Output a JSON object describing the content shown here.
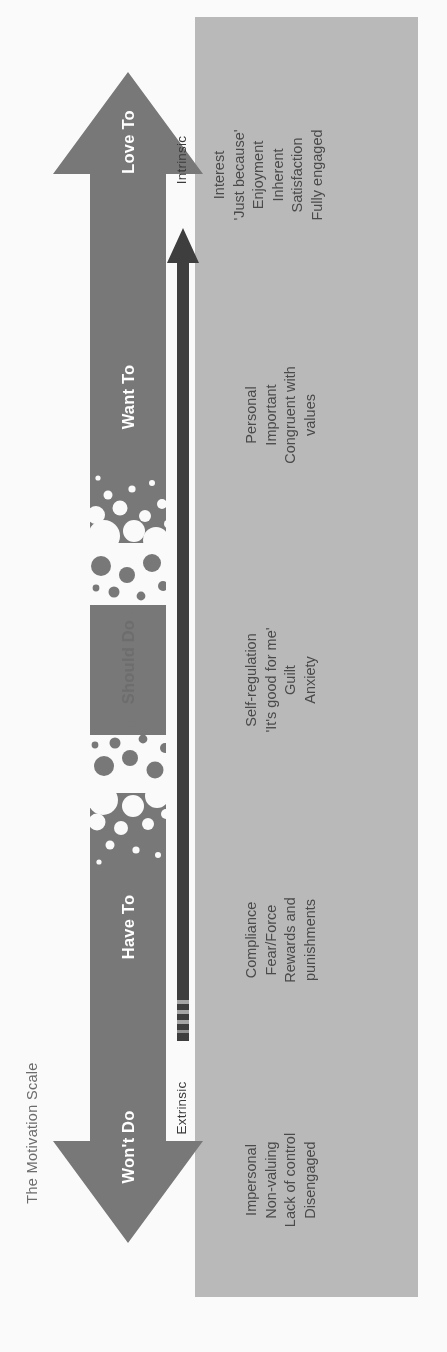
{
  "title": "The Motivation Scale",
  "colors": {
    "arrow_fill": "#7a7a7a",
    "panel_fill": "#bdbdbd",
    "inner_arrow": "#3f3f3f",
    "band_text": "#ffffff",
    "should_do_text": "#6d6d6d",
    "descriptor_text": "#4a4a4a",
    "title_text": "#6e6e6e",
    "page_background": "#ffffff"
  },
  "axis": {
    "low_end_label": "Extrinsic",
    "high_end_label": "Intrinsic"
  },
  "bands": [
    {
      "label": "Love To",
      "style": "white",
      "descriptors": [
        "Interest",
        "'Just because'",
        "Enjoyment",
        "Inherent",
        "Satisfaction",
        "Fully engaged"
      ]
    },
    {
      "label": "Want To",
      "style": "white",
      "descriptors": [
        "Personal",
        "Important",
        "Congruent with",
        "values"
      ]
    },
    {
      "label": "Should Do",
      "style": "dark",
      "descriptors": [
        "Self-regulation",
        "'It's good for me'",
        "Guilt",
        "Anxiety"
      ]
    },
    {
      "label": "Have To",
      "style": "white",
      "descriptors": [
        "Compliance",
        "Fear/Force",
        "Rewards and",
        "punishments"
      ]
    },
    {
      "label": "Won't Do",
      "style": "white",
      "descriptors": [
        "Impersonal",
        "Non-valuing",
        "Lack of control",
        "Disengaged"
      ]
    }
  ]
}
